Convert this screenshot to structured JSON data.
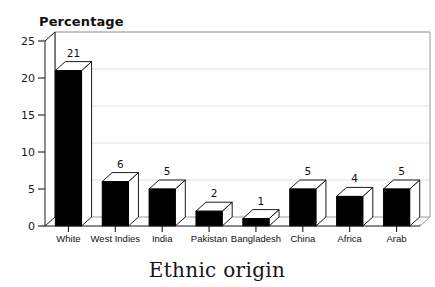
{
  "chart_data": {
    "type": "bar",
    "title": "",
    "xlabel": "Ethnic origin",
    "ylabel": "Percentage",
    "categories": [
      "White",
      "West Indies",
      "India",
      "Pakistan",
      "Bangladesh",
      "China",
      "Africa",
      "Arab"
    ],
    "values": [
      21,
      6,
      5,
      2,
      1,
      5,
      4,
      5
    ],
    "value_labels": [
      "21",
      "6",
      "5",
      "2",
      "1",
      "5",
      "4",
      "5"
    ],
    "ylim": [
      0,
      25
    ],
    "yticks": [
      0,
      5,
      10,
      15,
      20,
      25
    ],
    "ytick_labels": [
      "0",
      "5",
      "10",
      "15",
      "20",
      "25"
    ],
    "grid": true,
    "grid_axis": "y",
    "legend": false,
    "style": "3d-bars",
    "bar_color": "#000000",
    "bar_face_color": "#ffffff",
    "background": "#ffffff"
  },
  "axes": {
    "y_axis_title": "Percentage",
    "x_axis_title": "Ethnic origin"
  }
}
